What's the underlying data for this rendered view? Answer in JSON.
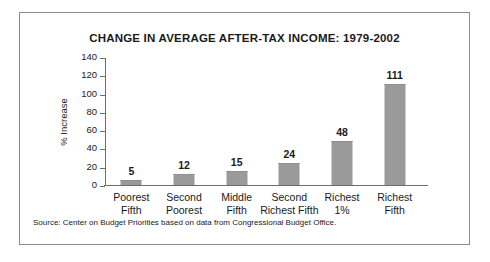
{
  "figure": {
    "source_note": "Source: Center on Budget Priorities based on data from Congressional Budget Office.",
    "border_color": "#8c8c8c",
    "background": "#ffffff"
  },
  "chart_data": {
    "type": "bar",
    "title": "CHANGE IN AVERAGE AFTER-TAX INCOME: 1979-2002",
    "xlabel": "",
    "ylabel": "% Increase",
    "categories": [
      "Poorest Fifth",
      "Second Poorest",
      "Middle Fifth",
      "Second Richest Fifth",
      "Richest 1%",
      "Richest Fifth"
    ],
    "category_lines": [
      [
        "Poorest",
        "Fifth"
      ],
      [
        "Second",
        "Poorest"
      ],
      [
        "Middle",
        "Fifth"
      ],
      [
        "Second",
        "Richest Fifth"
      ],
      [
        "Richest",
        "1%"
      ],
      [
        "Richest",
        "Fifth"
      ]
    ],
    "values": [
      5,
      12,
      15,
      24,
      48,
      111
    ],
    "value_labels": [
      "5",
      "12",
      "15",
      "24",
      "48",
      "111"
    ],
    "ylim": [
      0,
      140
    ],
    "yticks": [
      0,
      20,
      40,
      60,
      80,
      100,
      120,
      140
    ],
    "ytick_labels": [
      "0",
      "20",
      "40",
      "60",
      "80",
      "100",
      "120",
      "140"
    ],
    "grid": false,
    "legend": false,
    "bar_color": "#9a9a9a",
    "axis_color": "#6e6e6e"
  }
}
